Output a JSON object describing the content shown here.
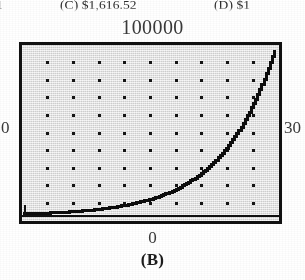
{
  "page": {
    "panel_label": "(B)"
  },
  "choices_strip": {
    "note": "partially cropped multiple-choice answer line at top of page",
    "items": [
      {
        "name": "choice-a-fragment",
        "text": "1"
      },
      {
        "name": "choice-c",
        "text": "(C)  $1,616.52"
      },
      {
        "name": "choice-d",
        "text": "(D) $1"
      }
    ]
  },
  "chart_data": {
    "type": "line",
    "title": "",
    "subtitle": "",
    "panel": "(B)",
    "xlabel": "",
    "ylabel": "",
    "x_axis_min_label": "0",
    "x_axis_max_label": "30",
    "y_axis_min_label": "0",
    "y_axis_max_label": "100000",
    "xlim": [
      0,
      30
    ],
    "ylim": [
      0,
      100000
    ],
    "grid": "dotted",
    "grid_columns": 9,
    "grid_rows": 9,
    "x_tick_count": 10,
    "y_tick_count": 9,
    "legend": "none",
    "style": "graphing-calculator-screen",
    "series": [
      {
        "name": "exponential-growth",
        "description": "exponential curve rising from near zero at x=0 to the maximum at x=30",
        "x": [
          0,
          2,
          4,
          6,
          8,
          10,
          12,
          14,
          16,
          18,
          20,
          22,
          24,
          26,
          28,
          30
        ],
        "values": [
          1000,
          1400,
          1960,
          2750,
          3850,
          5400,
          7550,
          10600,
          14800,
          20700,
          29000,
          40600,
          56800,
          79500,
          111000,
          100000
        ],
        "plotted_y": [
          900,
          1300,
          1900,
          2700,
          3800,
          5300,
          7500,
          10500,
          14700,
          20600,
          28900,
          40500,
          56700,
          72000,
          88000,
          99000
        ]
      }
    ],
    "annotations": [
      {
        "name": "y-max-label",
        "text": "100000",
        "position": "above-plot-center"
      },
      {
        "name": "y-min-label",
        "text": "0",
        "position": "left-of-plot-middle"
      },
      {
        "name": "x-max-label",
        "text": "30",
        "position": "right-of-plot-middle"
      },
      {
        "name": "x-min-label",
        "text": "0",
        "position": "below-plot-center"
      }
    ]
  }
}
